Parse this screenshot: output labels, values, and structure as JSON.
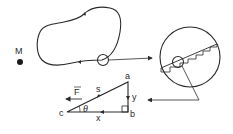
{
  "diagram": {
    "type": "physics-work-along-curve",
    "stroke_color": "#2a2a2a",
    "background": "#ffffff",
    "point_mass": {
      "label": "M"
    },
    "path": {
      "description": "closed curve with direction arrows",
      "arrow_count": 2
    },
    "magnified_view": {
      "description": "circle showing path approximated by staircase steps"
    },
    "triangle": {
      "vertices": {
        "top": "a",
        "right_angle": "b",
        "left": "c"
      },
      "sides": {
        "hypotenuse": "s",
        "vertical": "y",
        "horizontal": "x"
      },
      "angle": "θ",
      "force_label": "F"
    }
  }
}
